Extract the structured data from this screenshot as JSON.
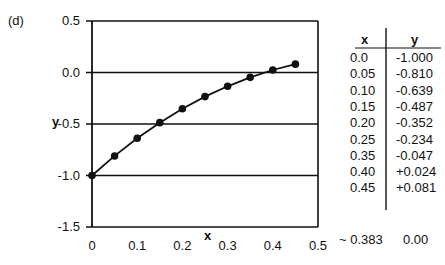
{
  "panel_label": "(d)",
  "chart_data": {
    "type": "line",
    "title": "",
    "panel": "(d)",
    "xlabel": "x",
    "ylabel": "y",
    "xlim": [
      0,
      0.5
    ],
    "ylim": [
      -1.5,
      0.5
    ],
    "grid": "horizontal",
    "x_ticks": [
      "0",
      "0.1",
      "0.2",
      "0.3",
      "0.4",
      "0.5"
    ],
    "y_ticks": [
      "0.5",
      "0.0",
      "-0.5",
      "-1.0",
      "-1.5"
    ],
    "markers": true,
    "series": [
      {
        "name": "y(x)",
        "x": [
          0.0,
          0.05,
          0.1,
          0.15,
          0.2,
          0.25,
          0.3,
          0.35,
          0.4,
          0.45
        ],
        "y": [
          -1.0,
          -0.81,
          -0.639,
          -0.487,
          -0.352,
          -0.234,
          -0.134,
          -0.047,
          0.024,
          0.081
        ]
      }
    ]
  },
  "table": {
    "headers": [
      "x",
      "y"
    ],
    "rows": [
      [
        "0.0",
        "-1.000"
      ],
      [
        "0.05",
        "-0.810"
      ],
      [
        "0.10",
        "-0.639"
      ],
      [
        "0.15",
        "-0.487"
      ],
      [
        "0.20",
        "-0.352"
      ],
      [
        "0.25",
        "-0.234"
      ],
      [
        "0.35",
        "-0.047"
      ],
      [
        "0.40",
        "+0.024"
      ],
      [
        "0.45",
        "+0.081"
      ]
    ],
    "root_row": [
      "~ 0.383",
      "0.00"
    ]
  }
}
